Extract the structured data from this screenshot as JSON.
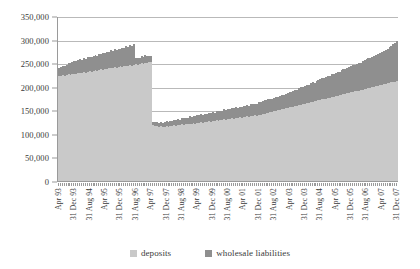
{
  "chart_data": {
    "type": "bar",
    "stacked": true,
    "title": "",
    "xlabel": "",
    "ylabel": "",
    "ylim": [
      0,
      350000
    ],
    "ytick_values": [
      0,
      50000,
      100000,
      150000,
      200000,
      250000,
      300000,
      350000
    ],
    "ytick_labels": [
      "0",
      "50,000",
      "100,000",
      "150,000",
      "200,000",
      "250,000",
      "300,000",
      "350,000"
    ],
    "grid": true,
    "legend_position": "bottom",
    "legend": [
      "deposits",
      "wholesale liabilities"
    ],
    "colors": {
      "deposits": "#c9c9c9",
      "wholesale_liabilities": "#8f8f8f",
      "gridline": "#b9b9b9",
      "axis": "#9a9a9a",
      "text": "#3a3a3a"
    },
    "xtick_labels": [
      "Apr 93",
      "31 Dec 93",
      "31 Aug 94",
      "Apr 95",
      "31 Dec 95",
      "31 Aug 96",
      "Apr 97",
      "31 Dec 97",
      "31 Aug 98",
      "Apr 99",
      "31 Dec 99",
      "31 Aug 00",
      "Apr 01",
      "31 Dec 01",
      "31 Aug 02",
      "Apr 03",
      "31 Dec 03",
      "31 Aug 04",
      "Apr 05",
      "31 Dec 05",
      "31 Aug 06",
      "Apr 07",
      "31 Dec 07"
    ],
    "xtick_every": 8,
    "categories": [
      "Apr 93",
      "May 93",
      "Jun 93",
      "Jul 93",
      "Aug 93",
      "Sep 93",
      "Oct 93",
      "Nov 93",
      "31 Dec 93",
      "Jan 94",
      "Feb 94",
      "Mar 94",
      "Apr 94",
      "May 94",
      "Jun 94",
      "Jul 94",
      "31 Aug 94",
      "Sep 94",
      "Oct 94",
      "Nov 94",
      "Dec 94",
      "Jan 95",
      "Feb 95",
      "Mar 95",
      "Apr 95",
      "May 95",
      "Jun 95",
      "Jul 95",
      "Aug 95",
      "Sep 95",
      "Oct 95",
      "Nov 95",
      "31 Dec 95",
      "Jan 96",
      "Feb 96",
      "Mar 96",
      "Apr 96",
      "May 96",
      "Jun 96",
      "Jul 96",
      "31 Aug 96",
      "Sep 96",
      "Oct 96",
      "Nov 96",
      "Dec 96",
      "Jan 97",
      "Feb 97",
      "Mar 97",
      "Apr 97",
      "May 97",
      "Jun 97",
      "Jul 97",
      "Aug 97",
      "Sep 97",
      "Oct 97",
      "Nov 97",
      "31 Dec 97",
      "Jan 98",
      "Feb 98",
      "Mar 98",
      "Apr 98",
      "May 98",
      "Jun 98",
      "Jul 98",
      "31 Aug 98",
      "Sep 98",
      "Oct 98",
      "Nov 98",
      "Dec 98",
      "Jan 99",
      "Feb 99",
      "Mar 99",
      "Apr 99",
      "May 99",
      "Jun 99",
      "Jul 99",
      "Aug 99",
      "Sep 99",
      "Oct 99",
      "Nov 99",
      "31 Dec 99",
      "Jan 00",
      "Feb 00",
      "Mar 00",
      "Apr 00",
      "May 00",
      "Jun 00",
      "Jul 00",
      "31 Aug 00",
      "Sep 00",
      "Oct 00",
      "Nov 00",
      "Dec 00",
      "Jan 01",
      "Feb 01",
      "Mar 01",
      "Apr 01",
      "May 01",
      "Jun 01",
      "Jul 01",
      "Aug 01",
      "Sep 01",
      "Oct 01",
      "Nov 01",
      "31 Dec 01",
      "Jan 02",
      "Feb 02",
      "Mar 02",
      "Apr 02",
      "May 02",
      "Jun 02",
      "Jul 02",
      "31 Aug 02",
      "Sep 02",
      "Oct 02",
      "Nov 02",
      "Dec 02",
      "Jan 03",
      "Feb 03",
      "Mar 03",
      "Apr 03",
      "May 03",
      "Jun 03",
      "Jul 03",
      "Aug 03",
      "Sep 03",
      "Oct 03",
      "Nov 03",
      "31 Dec 03",
      "Jan 04",
      "Feb 04",
      "Mar 04",
      "Apr 04",
      "May 04",
      "Jun 04",
      "Jul 04",
      "31 Aug 04",
      "Sep 04",
      "Oct 04",
      "Nov 04",
      "Dec 04",
      "Jan 05",
      "Feb 05",
      "Mar 05",
      "Apr 05",
      "May 05",
      "Jun 05",
      "Jul 05",
      "Aug 05",
      "Sep 05",
      "Oct 05",
      "Nov 05",
      "31 Dec 05",
      "Jan 06",
      "Feb 06",
      "Mar 06",
      "Apr 06",
      "May 06",
      "Jun 06",
      "Jul 06",
      "31 Aug 06",
      "Sep 06",
      "Oct 06",
      "Nov 06",
      "Dec 06",
      "Jan 07",
      "Feb 07",
      "Mar 07",
      "Apr 07",
      "May 07",
      "Jun 07",
      "Jul 07",
      "Aug 07",
      "Sep 07",
      "Oct 07",
      "Nov 07",
      "31 Dec 07"
    ],
    "series": [
      {
        "name": "deposits",
        "values": [
          222000,
          223000,
          224000,
          222000,
          225000,
          226000,
          224000,
          227000,
          228000,
          227000,
          229000,
          230000,
          229000,
          231000,
          230000,
          232000,
          233000,
          232000,
          234000,
          235000,
          234000,
          236000,
          237000,
          236000,
          238000,
          237000,
          239000,
          240000,
          239000,
          241000,
          240000,
          242000,
          243000,
          242000,
          244000,
          245000,
          244000,
          246000,
          245000,
          247000,
          248000,
          247000,
          249000,
          250000,
          249000,
          251000,
          250000,
          252000,
          253000,
          118000,
          116000,
          117000,
          115000,
          116000,
          114000,
          115000,
          116000,
          115000,
          117000,
          116000,
          118000,
          117000,
          119000,
          118000,
          120000,
          119000,
          121000,
          120000,
          122000,
          121000,
          123000,
          122000,
          124000,
          123000,
          125000,
          124000,
          126000,
          125000,
          127000,
          126000,
          128000,
          127000,
          129000,
          128000,
          130000,
          129000,
          131000,
          130000,
          132000,
          131000,
          133000,
          132000,
          134000,
          133000,
          135000,
          134000,
          136000,
          135000,
          137000,
          136000,
          138000,
          137000,
          139000,
          138000,
          140000,
          141000,
          142000,
          143000,
          144000,
          145000,
          146000,
          147000,
          148000,
          149000,
          150000,
          151000,
          152000,
          153000,
          154000,
          155000,
          156000,
          157000,
          158000,
          159000,
          160000,
          161000,
          162000,
          163000,
          164000,
          165000,
          166000,
          167000,
          168000,
          169000,
          170000,
          171000,
          172000,
          173000,
          174000,
          175000,
          176000,
          177000,
          178000,
          179000,
          180000,
          181000,
          182000,
          183000,
          184000,
          185000,
          186000,
          187000,
          188000,
          189000,
          190000,
          191000,
          192000,
          193000,
          194000,
          195000,
          196000,
          197000,
          198000,
          199000,
          200000,
          201000,
          202000,
          203000,
          204000,
          205000,
          206000,
          207000,
          208000,
          209000,
          210000,
          211000,
          212000
        ]
      },
      {
        "name": "wholesale liabilities",
        "values": [
          18000,
          19000,
          21000,
          23000,
          22000,
          24000,
          26000,
          25000,
          26000,
          28000,
          27000,
          29000,
          28000,
          30000,
          29000,
          31000,
          30000,
          32000,
          31000,
          33000,
          32000,
          34000,
          33000,
          35000,
          34000,
          36000,
          35000,
          37000,
          36000,
          38000,
          37000,
          39000,
          38000,
          40000,
          39000,
          41000,
          40000,
          42000,
          41000,
          43000,
          12000,
          14000,
          13000,
          15000,
          14000,
          16000,
          15000,
          14000,
          13000,
          8000,
          9000,
          8000,
          9000,
          10000,
          9000,
          10000,
          11000,
          10000,
          11000,
          12000,
          11000,
          12000,
          13000,
          12000,
          13000,
          14000,
          13000,
          14000,
          15000,
          14000,
          15000,
          16000,
          15000,
          16000,
          17000,
          16000,
          17000,
          18000,
          17000,
          18000,
          19000,
          18000,
          19000,
          20000,
          19000,
          20000,
          21000,
          20000,
          21000,
          22000,
          21000,
          22000,
          23000,
          22000,
          23000,
          24000,
          23000,
          24000,
          25000,
          24000,
          25000,
          26000,
          25000,
          26000,
          27000,
          26000,
          27000,
          28000,
          27000,
          28000,
          29000,
          28000,
          29000,
          30000,
          29000,
          30000,
          31000,
          30000,
          31000,
          32000,
          33000,
          32000,
          34000,
          35000,
          34000,
          36000,
          37000,
          36000,
          38000,
          39000,
          38000,
          40000,
          41000,
          40000,
          42000,
          43000,
          44000,
          45000,
          44000,
          46000,
          47000,
          46000,
          48000,
          49000,
          50000,
          51000,
          50000,
          52000,
          53000,
          52000,
          54000,
          55000,
          56000,
          57000,
          56000,
          58000,
          59000,
          58000,
          60000,
          61000,
          62000,
          63000,
          64000,
          65000,
          66000,
          67000,
          68000,
          69000,
          70000,
          71000,
          72000,
          74000,
          76000,
          78000,
          80000,
          82000,
          86000
        ]
      }
    ]
  }
}
